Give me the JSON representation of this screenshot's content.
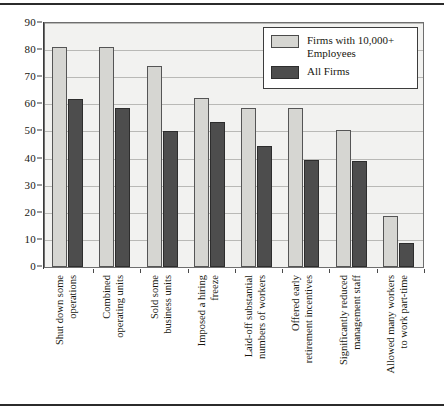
{
  "chart_data": {
    "type": "bar",
    "title": "",
    "subtitle": "",
    "xlabel": "",
    "ylabel": "",
    "ylim": [
      0,
      90
    ],
    "ytick_step": 10,
    "ytick_labels": [
      "0",
      "10",
      "20",
      "30",
      "40",
      "50",
      "60",
      "70",
      "80",
      "90"
    ],
    "grid": true,
    "legend_position": "top-right",
    "categories": [
      "Shut down some operations",
      "Combined operating units",
      "Sold some business units",
      "Imposed a hiring freeze",
      "Laid-off substantial numbers of workers",
      "Offered early retirement incentives",
      "Significantly reduced management staff",
      "Allowed many workers to work part-time"
    ],
    "category_lines": [
      [
        "Shut down some",
        "operations"
      ],
      [
        "Combined",
        "operating units"
      ],
      [
        "Sold some",
        "business units"
      ],
      [
        "Imposed a hiring",
        "freeze"
      ],
      [
        "Laid-off substantial",
        "numbers of workers"
      ],
      [
        "Offered early",
        "retirement incentives"
      ],
      [
        "Significantly reduced",
        "management staff"
      ],
      [
        "Allowed many workers",
        "to work part-time"
      ]
    ],
    "series": [
      {
        "name": "Firms with 10,000+ Employees",
        "color": "#d6d6d2",
        "values": [
          81,
          81,
          74,
          62.5,
          58.5,
          58.5,
          50.5,
          19
        ]
      },
      {
        "name": "All Firms",
        "color": "#4d4d4d",
        "values": [
          62,
          58.5,
          50,
          53.5,
          44.5,
          39.5,
          39,
          9
        ]
      }
    ]
  },
  "legend": {
    "items": [
      {
        "label_line1": "Firms with 10,000+",
        "label_line2": "Employees",
        "swatch": "light"
      },
      {
        "label_line1": "All Firms",
        "label_line2": "",
        "swatch": "dark"
      }
    ]
  },
  "colors": {
    "series_light": "#d6d6d2",
    "series_dark": "#4d4d4d",
    "plot_background": "#f2f2f0",
    "gridline": "#b9b9b6",
    "axis": "#3a3a3a",
    "text": "#17170f",
    "rule": "#2b2b2b"
  }
}
